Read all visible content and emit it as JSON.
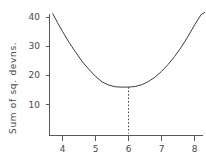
{
  "figure": {
    "background_color": "#ffffff",
    "line_color": "#3c3c3c",
    "axis_color": "#59595b",
    "text_color": "#4a4a4a"
  },
  "chart_data": {
    "type": "line",
    "title": "",
    "subtitle": "",
    "xlabel": "",
    "ylabel": "Sum of sq. devns.",
    "xlim": [
      3.62,
      8.42
    ],
    "ylim": [
      0,
      44
    ],
    "grid": false,
    "legend": null,
    "xticks": [
      4,
      5,
      6,
      7,
      8
    ],
    "xticklabels": [
      "4",
      "5",
      "6",
      "7",
      "8"
    ],
    "yticks": [
      10,
      20,
      30,
      40
    ],
    "yticklabels": [
      "10",
      "20",
      "30",
      "40"
    ],
    "series": [
      {
        "name": "sum of squared deviations",
        "x": [
          3.7,
          3.85,
          4.0,
          4.2,
          4.4,
          4.6,
          4.8,
          5.0,
          5.2,
          5.4,
          5.6,
          5.8,
          6.0,
          6.2,
          6.4,
          6.6,
          6.8,
          7.0,
          7.2,
          7.4,
          7.6,
          7.8,
          8.0,
          8.2,
          8.32
        ],
        "y": [
          41.4,
          38.2,
          35.2,
          31.4,
          28.0,
          24.8,
          22.1,
          19.7,
          17.8,
          16.7,
          16.1,
          16.0,
          16.0,
          16.2,
          16.8,
          17.9,
          19.4,
          21.4,
          23.8,
          26.6,
          29.8,
          33.4,
          37.4,
          41.0,
          41.8
        ]
      }
    ],
    "annotations": [
      {
        "type": "vertical-dotted-dropline",
        "x": 6,
        "y_from": 16,
        "y_to": 0,
        "label": ""
      }
    ],
    "minimum": {
      "x": 6,
      "y": 16
    }
  }
}
